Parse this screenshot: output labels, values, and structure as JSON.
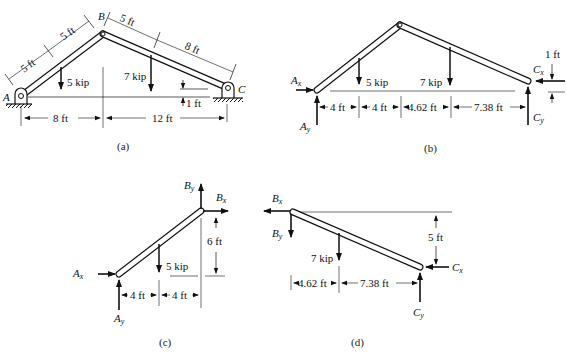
{
  "figure": {
    "panels": [
      {
        "id": "a",
        "caption": "(a)",
        "points": {
          "A": "A",
          "B": "B",
          "C": "C"
        },
        "labels": {
          "seg1": "5 ft",
          "seg2": "5 ft",
          "seg3": "5 ft",
          "seg4": "8 ft",
          "load1": "5 kip",
          "load2": "7 kip",
          "span1": "8 ft",
          "span2": "12 ft",
          "rise": "1 ft"
        }
      },
      {
        "id": "b",
        "caption": "(b)",
        "labels": {
          "Ax": "A",
          "Ax_sub": "x",
          "Ay": "A",
          "Ay_sub": "y",
          "Cx": "C",
          "Cx_sub": "x",
          "Cy": "C",
          "Cy_sub": "y",
          "load1": "5 kip",
          "load2": "7 kip",
          "d1": "4 ft",
          "d2": "4 ft",
          "d3": "4.62 ft",
          "d4": "7.38 ft",
          "rise": "1 ft"
        }
      },
      {
        "id": "c",
        "caption": "(c)",
        "labels": {
          "Ax": "A",
          "Ax_sub": "x",
          "Ay": "A",
          "Ay_sub": "y",
          "Bx": "B",
          "Bx_sub": "x",
          "By": "B",
          "By_sub": "y",
          "load1": "5 kip",
          "d1": "4 ft",
          "d2": "4 ft",
          "height": "6 ft"
        }
      },
      {
        "id": "d",
        "caption": "(d)",
        "labels": {
          "Bx": "B",
          "Bx_sub": "x",
          "By": "B",
          "By_sub": "y",
          "Cx": "C",
          "Cx_sub": "x",
          "Cy": "C",
          "Cy_sub": "y",
          "load2": "7 kip",
          "d1": "4.62 ft",
          "d2": "7.38 ft",
          "height": "5 ft"
        }
      }
    ],
    "colors": {
      "ink": "#111111",
      "member_fill": "#ffffff"
    }
  }
}
